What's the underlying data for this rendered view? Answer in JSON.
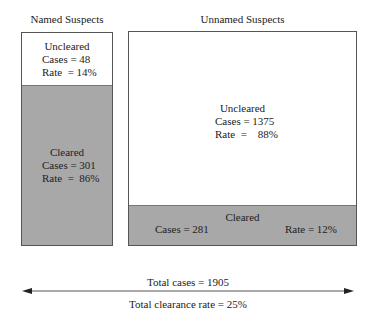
{
  "colors": {
    "cleared_fill": "#a8a8a8",
    "uncleared_fill": "#ffffff",
    "border": "#555555"
  },
  "named": {
    "title": "Named Suspects",
    "uncleared": {
      "label": "Uncleared",
      "cases": "Cases = 48",
      "rate": "Rate  = 14%"
    },
    "cleared": {
      "label": "Cleared",
      "cases": "Cases = 301",
      "rate": "Rate  =  86%"
    }
  },
  "unnamed": {
    "title": "Unnamed Suspects",
    "uncleared": {
      "label": "Uncleared",
      "cases": "Cases = 1375",
      "rate": "Rate  =    88%"
    },
    "cleared": {
      "label": "Cleared",
      "cases": "Cases = 281",
      "rate": "Rate = 12%"
    }
  },
  "totals": {
    "cases": "Total cases = 1905",
    "clearance_rate": "Total clearance rate = 25%"
  }
}
